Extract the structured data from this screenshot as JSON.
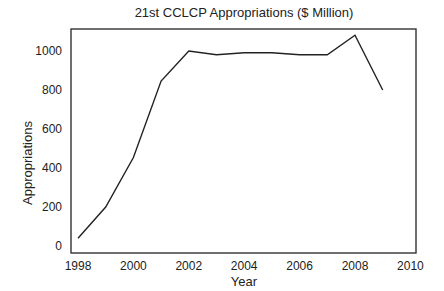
{
  "chart_data": {
    "type": "line",
    "title": "21st CCLCP Appropriations ($ Million)",
    "xlabel": "Year",
    "ylabel": "Appropriations",
    "x": [
      1998,
      1999,
      2000,
      2001,
      2002,
      2003,
      2004,
      2005,
      2006,
      2007,
      2008,
      2009
    ],
    "series": [
      {
        "name": "Appropriations",
        "values": [
          40,
          200,
          454,
          846,
          1000,
          981,
          991,
          991,
          981,
          981,
          1081,
          800
        ]
      }
    ],
    "xticks": [
      "1998",
      "2000",
      "2002",
      "2004",
      "2006",
      "2008",
      "2010"
    ],
    "yticks": [
      "0",
      "200",
      "400",
      "600",
      "800",
      "1000"
    ],
    "xlim": [
      1998,
      2010
    ],
    "ylim": [
      0,
      1000
    ],
    "grid": false,
    "legend": "none",
    "line_color": "#222222"
  }
}
